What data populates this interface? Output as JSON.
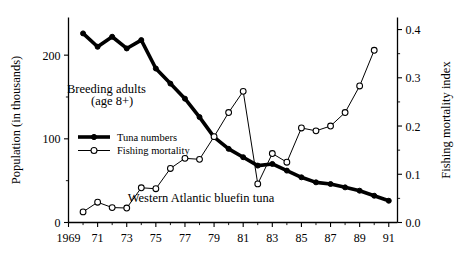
{
  "chart_data": {
    "type": "line",
    "title": "",
    "annotations": [
      {
        "name": "breeding-adults",
        "text": "Breeding adults",
        "x": 1971.6,
        "y_left": 155
      },
      {
        "name": "breeding-adults-age",
        "text": "(age 8+)",
        "x": 1972.0,
        "y_left": 140
      },
      {
        "name": "species-caption",
        "text": "Western Atlantic bluefin tuna",
        "x": 1978.1,
        "y_left": 24
      }
    ],
    "xlabel": "",
    "xlim": [
      1969,
      1991.6
    ],
    "x_ticks": [
      1969,
      1971,
      1973,
      1975,
      1977,
      1979,
      1981,
      1983,
      1985,
      1987,
      1989,
      1991
    ],
    "x_tick_labels": [
      "1969",
      "71",
      "73",
      "75",
      "77",
      "79",
      "81",
      "83",
      "85",
      "87",
      "89",
      "91"
    ],
    "x_minor_ticks": [
      1970,
      1972,
      1974,
      1976,
      1978,
      1980,
      1982,
      1984,
      1986,
      1988,
      1990
    ],
    "ylabel": "Population (in thousands)",
    "ylim": [
      0,
      245
    ],
    "y_ticks": [
      0,
      100,
      200
    ],
    "y_tick_labels": [
      "0",
      "100",
      "200"
    ],
    "y_minor_ticks": [
      50,
      150
    ],
    "y2label": "Fishing mortality index",
    "y2lim": [
      0.0,
      0.425
    ],
    "y2_ticks": [
      0.0,
      0.1,
      0.2,
      0.3,
      0.4
    ],
    "y2_tick_labels": [
      "0.0",
      "0.1",
      "0.2",
      "0.3",
      "0.4"
    ],
    "y2_minor_ticks": [
      0.05,
      0.15,
      0.25,
      0.35
    ],
    "grid": false,
    "legend_position": "upper-left-inside",
    "series": [
      {
        "name": "Tuna numbers",
        "axis": "left",
        "marker": "filled-circle",
        "x": [
          1970,
          1971,
          1972,
          1973,
          1974,
          1975,
          1976,
          1977,
          1978,
          1979,
          1980,
          1981,
          1982,
          1983,
          1984,
          1985,
          1986,
          1987,
          1988,
          1989,
          1990,
          1991
        ],
        "values": [
          226,
          210,
          222,
          208,
          218,
          184,
          166,
          148,
          126,
          102,
          88,
          78,
          68,
          70,
          62,
          54,
          48,
          46,
          42,
          38,
          32,
          26
        ]
      },
      {
        "name": "Fishing mortality",
        "axis": "right",
        "marker": "open-circle",
        "x": [
          1970,
          1971,
          1972,
          1973,
          1974,
          1975,
          1976,
          1977,
          1978,
          1979,
          1980,
          1981,
          1982,
          1983,
          1984,
          1985,
          1986,
          1987,
          1988,
          1989,
          1990
        ],
        "values": [
          0.022,
          0.042,
          0.031,
          0.03,
          0.072,
          0.07,
          0.112,
          0.133,
          0.131,
          0.178,
          0.228,
          0.272,
          0.08,
          0.143,
          0.125,
          0.196,
          0.19,
          0.2,
          0.228,
          0.283,
          0.357
        ]
      }
    ],
    "legend_entries": [
      {
        "label": "Tuna numbers",
        "marker": "filled-circle",
        "line": "thick"
      },
      {
        "label": "Fishing mortality",
        "marker": "open-circle",
        "line": "thin"
      }
    ]
  }
}
